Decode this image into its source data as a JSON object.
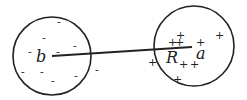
{
  "diagram": {
    "left_sphere": {
      "label": "b",
      "charge_symbol": "-",
      "charge_sign": "negative"
    },
    "right_sphere": {
      "label": "a",
      "charge_symbol": "+",
      "charge_sign": "positive"
    },
    "line_label": "R",
    "colors": {
      "stroke": "#222222",
      "background": "#ffffff"
    }
  }
}
